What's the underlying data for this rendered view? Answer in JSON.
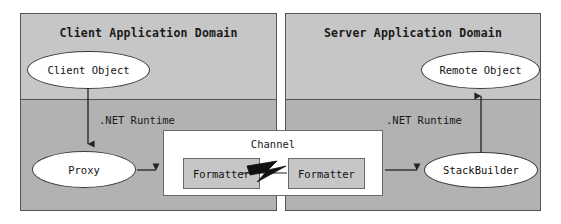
{
  "diagram": {
    "colors": {
      "page_background": "#ffffff",
      "domain_fill_upper": "#c6c6c6",
      "domain_fill_lower": "#b2b2b2",
      "domain_border": "#555555",
      "node_fill": "#ffffff",
      "node_border": "#3a3a3a",
      "channel_fill": "#ffffff",
      "channel_border": "#6a6a6a",
      "formatter_fill": "#c6c6c6",
      "bolt_fill": "#111111",
      "text": "#1a1a1a"
    }
  },
  "client_domain": {
    "title": "Client Application Domain",
    "runtime_label": ".NET Runtime",
    "client_object": "Client Object",
    "proxy": "Proxy"
  },
  "server_domain": {
    "title": "Server Application Domain",
    "runtime_label": ".NET Runtime",
    "remote_object": "Remote Object",
    "stack_builder": "StackBuilder"
  },
  "channel": {
    "title": "Channel",
    "formatter_left": "Formatter",
    "formatter_right": "Formatter",
    "link_icon": "lightning-bolt-icon"
  },
  "connectors": [
    {
      "name": "client-object-to-proxy",
      "from": "Client Object",
      "to": "Proxy",
      "direction": "down"
    },
    {
      "name": "proxy-to-channel",
      "from": "Proxy",
      "to": "Channel",
      "direction": "right"
    },
    {
      "name": "formatter-to-formatter",
      "from": "Formatter",
      "to": "Formatter",
      "direction": "right"
    },
    {
      "name": "channel-to-stackbuilder",
      "from": "Channel",
      "to": "StackBuilder",
      "direction": "right"
    },
    {
      "name": "stackbuilder-to-remote-object",
      "from": "StackBuilder",
      "to": "Remote Object",
      "direction": "up"
    }
  ]
}
